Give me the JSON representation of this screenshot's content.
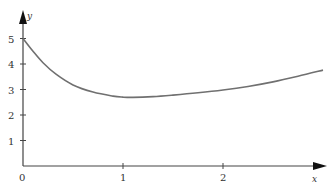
{
  "chart_data": {
    "type": "line",
    "title": "",
    "xlabel": "x",
    "ylabel": "y",
    "xlim": [
      0,
      3.0
    ],
    "ylim": [
      0,
      5.3
    ],
    "grid": false,
    "legend": null,
    "x_ticks": [
      "0",
      "1",
      "2"
    ],
    "y_ticks": [
      "1",
      "2",
      "3",
      "4",
      "5"
    ],
    "series": [
      {
        "name": "curve",
        "color": "#707070",
        "x": [
          0,
          0.1,
          0.2,
          0.33,
          0.5,
          0.7,
          0.9,
          1.0,
          1.1,
          1.3,
          1.5,
          1.75,
          2.0,
          2.25,
          2.5,
          2.75,
          3.0
        ],
        "y": [
          5.0,
          4.5,
          4.05,
          3.6,
          3.18,
          2.9,
          2.74,
          2.7,
          2.69,
          2.72,
          2.78,
          2.87,
          2.98,
          3.12,
          3.3,
          3.52,
          3.76
        ]
      }
    ]
  },
  "labels": {
    "origin": "0",
    "x_axis": "x",
    "y_axis": "y"
  }
}
